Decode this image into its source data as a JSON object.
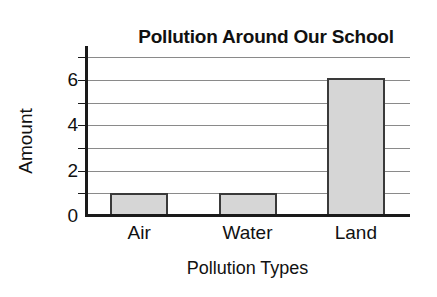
{
  "chart_data": {
    "type": "bar",
    "title": "Pollution Around Our School",
    "xlabel": "Pollution Types",
    "ylabel": "Amount",
    "categories": [
      "Air",
      "Water",
      "Land"
    ],
    "values": [
      1,
      1,
      6.1
    ],
    "ylim": [
      0,
      7.5
    ],
    "y_ticks": [
      0,
      2,
      4,
      6
    ],
    "y_tick_labels": [
      "0",
      "2",
      "4",
      "6"
    ],
    "gridlines": [
      1,
      2,
      3,
      4,
      5,
      6,
      7
    ],
    "grid": true,
    "legend": null,
    "bar_fill_color": "#d6d6d6",
    "bar_edge_color": "#3a3a3a",
    "gridline_color": "#8a8a8a",
    "axis_color": "#1a1a1a",
    "text_color": "#111111",
    "background_color": "#ffffff"
  }
}
